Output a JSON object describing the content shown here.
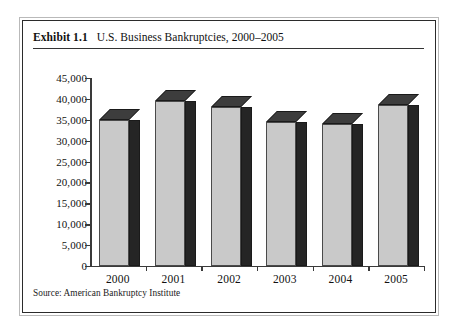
{
  "figure": {
    "exhibit_label": "Exhibit 1.1",
    "title": "U.S. Business Bankruptcies, 2000–2005",
    "source_note": "Source: American Bankruptcy Institute"
  },
  "colors": {
    "bar_front": "#c9c9c9",
    "bar_side": "#252525",
    "bar_top": "#3d3d3d",
    "axis": "#3a3a3a",
    "frame_inner": "#2b2b2b",
    "frame_outer": "#b9b9b9",
    "text": "#111111"
  },
  "chart_data": {
    "type": "bar",
    "title": "U.S. Business Bankruptcies, 2000–2005",
    "subtitle": "",
    "xlabel": "",
    "ylabel": "",
    "categories": [
      "2000",
      "2001",
      "2002",
      "2003",
      "2004",
      "2005"
    ],
    "values": [
      35000,
      39500,
      38000,
      34500,
      34000,
      38500
    ],
    "ylim": [
      0,
      45000
    ],
    "ytick_values": [
      0,
      5000,
      10000,
      15000,
      20000,
      25000,
      30000,
      35000,
      40000,
      45000
    ],
    "ytick_labels": [
      "0",
      "5,000",
      "10,000",
      "15,000",
      "20,000",
      "25,000",
      "30,000",
      "35,000",
      "40,000",
      "45,000"
    ],
    "grid": false,
    "legend": null,
    "style": "3d-column",
    "source": "American Bankruptcy Institute"
  }
}
